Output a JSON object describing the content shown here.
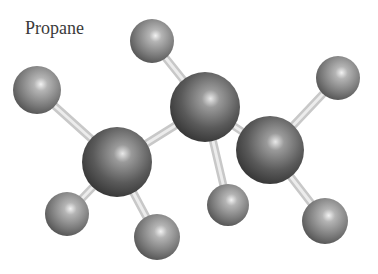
{
  "title": "Propane",
  "molecule": {
    "name": "Propane",
    "formula": "C3H8",
    "atoms": [
      {
        "id": "H1",
        "element": "H",
        "x": 37,
        "y": 90,
        "r": 24
      },
      {
        "id": "H2",
        "element": "H",
        "x": 152,
        "y": 41,
        "r": 22
      },
      {
        "id": "H3",
        "element": "H",
        "x": 338,
        "y": 78,
        "r": 22
      },
      {
        "id": "C1",
        "element": "C",
        "x": 117,
        "y": 162,
        "r": 35
      },
      {
        "id": "C2",
        "element": "C",
        "x": 205,
        "y": 107,
        "r": 35
      },
      {
        "id": "C3",
        "element": "C",
        "x": 270,
        "y": 150,
        "r": 34
      },
      {
        "id": "H4",
        "element": "H",
        "x": 67,
        "y": 214,
        "r": 22
      },
      {
        "id": "H5",
        "element": "H",
        "x": 157,
        "y": 237,
        "r": 23
      },
      {
        "id": "H6",
        "element": "H",
        "x": 228,
        "y": 205,
        "r": 21
      },
      {
        "id": "H7",
        "element": "H",
        "x": 325,
        "y": 221,
        "r": 23
      }
    ],
    "bonds": [
      [
        "H1",
        "C1"
      ],
      [
        "C1",
        "C2"
      ],
      [
        "C2",
        "H2"
      ],
      [
        "C2",
        "C3"
      ],
      [
        "C2",
        "H6"
      ],
      [
        "C3",
        "H3"
      ],
      [
        "C3",
        "H7"
      ],
      [
        "C1",
        "H4"
      ],
      [
        "C1",
        "H5"
      ]
    ]
  }
}
